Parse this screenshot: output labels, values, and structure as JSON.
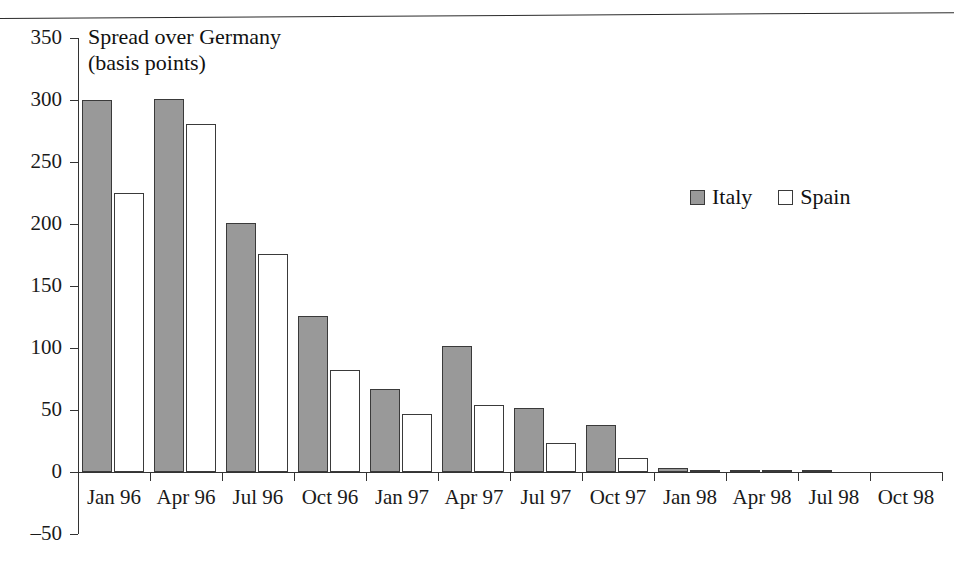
{
  "chart_data": {
    "type": "bar",
    "title": "",
    "axis_note": "Spread over Germany\n(basis points)",
    "axis_note_line1": "Spread over Germany",
    "axis_note_line2": "(basis points)",
    "xlabel": "",
    "ylabel": "Spread over Germany (basis points)",
    "ylim": [
      -50,
      350
    ],
    "ytick_step": 50,
    "grid": false,
    "legend_position": "upper right inside plot",
    "categories": [
      "Jan 96",
      "Apr 96",
      "Jul 96",
      "Oct 96",
      "Jan 97",
      "Apr 97",
      "Jul 97",
      "Oct 97",
      "Jan 98",
      "Apr 98",
      "Jul 98",
      "Oct 98"
    ],
    "ytick_labels": [
      "350",
      "300",
      "250",
      "200",
      "150",
      "100",
      "50",
      "0",
      "‒50"
    ],
    "ytick_values": [
      350,
      300,
      250,
      200,
      150,
      100,
      50,
      0,
      -50
    ],
    "series": [
      {
        "name": "Italy",
        "color": "#999999",
        "values": [
          300,
          301,
          201,
          126,
          67,
          102,
          52,
          38,
          3,
          2,
          1,
          0
        ]
      },
      {
        "name": "Spain",
        "color": "#ffffff",
        "values": [
          225,
          281,
          176,
          82,
          47,
          54,
          23,
          11,
          2,
          1,
          0,
          0
        ]
      }
    ]
  },
  "legend": {
    "entries": [
      {
        "label": "Italy",
        "swatch": "filled-gray-square"
      },
      {
        "label": "Spain",
        "swatch": "empty-white-square"
      }
    ]
  },
  "colors": {
    "italy_fill": "#999999",
    "spain_fill": "#ffffff",
    "bar_stroke": "#3a3a3a",
    "axis": "#333333",
    "text": "#1a1a1a"
  }
}
